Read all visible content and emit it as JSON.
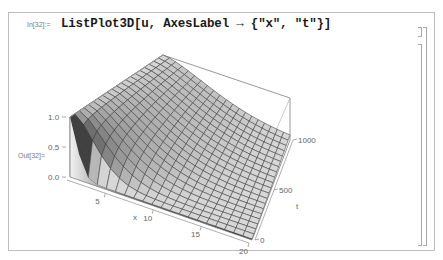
{
  "notebook": {
    "top_clipped_text": "",
    "input_cell": {
      "label": "In[32]:=",
      "code": "ListPlot3D[u, AxesLabel → {\"x\", \"t\"}]"
    },
    "output_cell": {
      "label": "Out[32]="
    },
    "brackets": [
      "input-cell-bracket",
      "output-cell-bracket",
      "group-bracket"
    ]
  },
  "plot": {
    "type": "ListPlot3D surface",
    "axes_labels": {
      "x": "x",
      "t": "t"
    },
    "x_ticks": [
      "5",
      "10",
      "15",
      "20"
    ],
    "t_ticks": [
      "0",
      "500",
      "1000"
    ],
    "z_ticks": [
      "0.0",
      "0.5",
      "1.0"
    ],
    "colors": {
      "mesh": "#3a3a3a",
      "box": "#7d7d7d",
      "surface_light": "#dcdcdc",
      "surface_dark": "#2e2e2e"
    }
  },
  "chart_data": {
    "type": "surface3d",
    "title": "",
    "xlabel": "x",
    "ylabel": "t",
    "zlabel": "",
    "x_range": [
      1,
      20
    ],
    "t_range": [
      0,
      1000
    ],
    "z_range": [
      0.0,
      1.0
    ],
    "x_ticks": [
      5,
      10,
      15,
      20
    ],
    "t_ticks": [
      0,
      500,
      1000
    ],
    "z_ticks": [
      0.0,
      0.5,
      1.0
    ],
    "grid": true
  }
}
